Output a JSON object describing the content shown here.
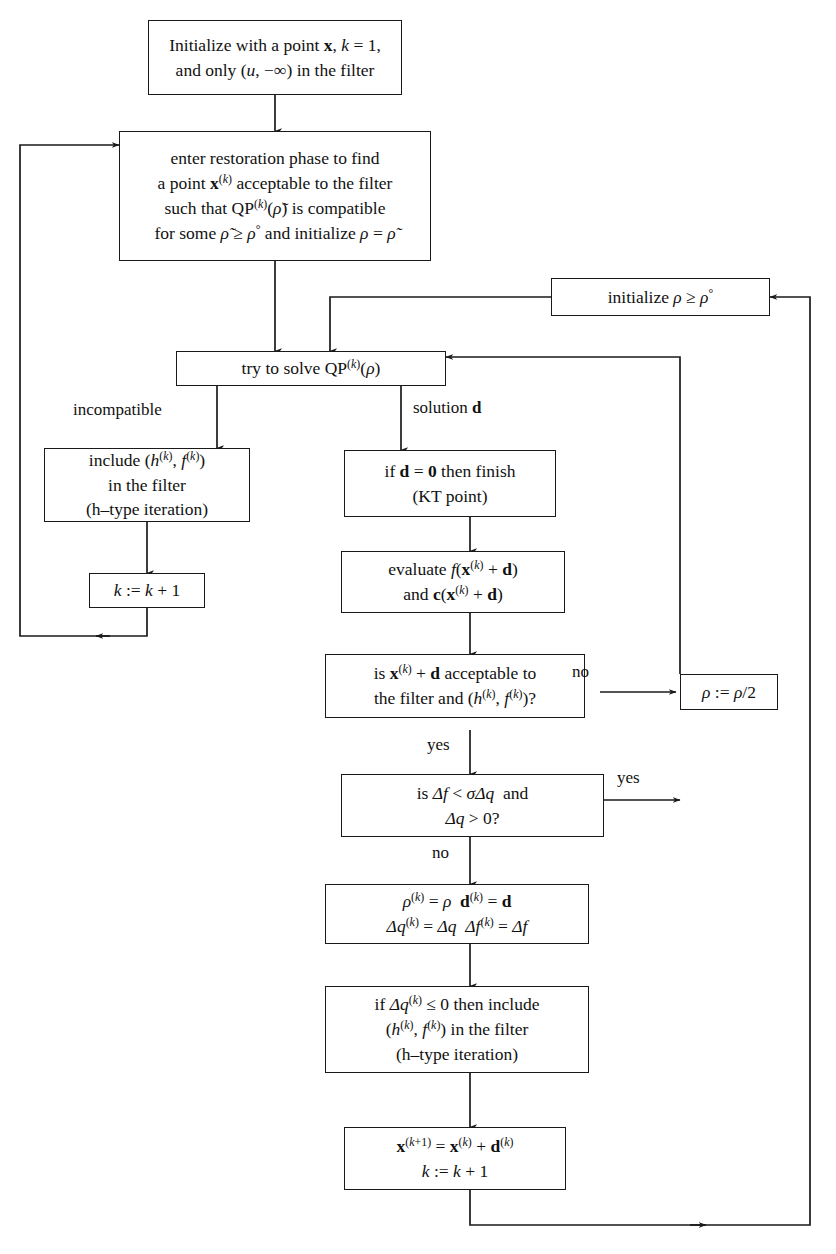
{
  "diagram": {
    "stroke_color": "#1a1a1a",
    "background": "#ffffff"
  },
  "nodes": {
    "initialize": {
      "id": "initialize-box",
      "lines": [
        "Initialize with a point x, k = 1,",
        "and only (u, −∞) in the filter"
      ]
    },
    "restoration": {
      "id": "restoration-phase-box",
      "lines": [
        "enter restoration phase to find",
        "a point x(k) acceptable to the filter",
        "such that QP(k)(ρ̃) is compatible",
        "for some ρ̃ ≥ ρ° and initialize ρ = ρ̃"
      ]
    },
    "initialize_rho": {
      "id": "initialize-rho-box",
      "lines": [
        "initialize ρ ≥ ρ°"
      ]
    },
    "try_solve_qp": {
      "id": "try-to-solve-qp-box",
      "lines": [
        "try to solve QP(k)(ρ)"
      ]
    },
    "include_filter": {
      "id": "include-in-filter-box",
      "lines": [
        "include (h(k), f(k))",
        "in the filter",
        "(h–type iteration)"
      ]
    },
    "k_increment": {
      "id": "k-increment-box",
      "lines": [
        "k := k + 1"
      ]
    },
    "kt_point": {
      "id": "kt-point-box",
      "lines": [
        "if d = 0 then finish",
        "(KT point)"
      ]
    },
    "evaluate": {
      "id": "evaluate-box",
      "lines": [
        "evaluate f(x(k) + d)",
        "and c(x(k) + d)"
      ]
    },
    "acceptable_test": {
      "id": "acceptability-decision-box",
      "lines": [
        "is x(k) + d acceptable to",
        "the filter and (h(k), f(k))?"
      ]
    },
    "rho_halve": {
      "id": "rho-halve-box",
      "lines": [
        "ρ := ρ/2"
      ]
    },
    "sufficient_reduction": {
      "id": "sufficient-reduction-decision-box",
      "lines": [
        "is Δf < σΔq  and",
        "Δq > 0?"
      ]
    },
    "assign_accepted": {
      "id": "assign-accepted-values-box",
      "lines": [
        "ρ(k) = ρ   d(k) = d",
        "Δq(k) = Δq   Δf(k) = Δf"
      ]
    },
    "maybe_include": {
      "id": "conditional-include-filter-box",
      "lines": [
        "if Δq(k) ≤ 0 then include",
        "(h(k), f(k)) in the filter",
        "(h–type iteration)"
      ]
    },
    "update_x": {
      "id": "update-iterate-box",
      "lines": [
        "x(k+1) = x(k) + d(k)",
        "k := k + 1"
      ]
    }
  },
  "edge_labels": {
    "incompatible": "incompatible",
    "solution_d": "solution d",
    "no_acceptable": "no",
    "yes_acceptable": "yes",
    "yes_reduction": "yes",
    "no_reduction": "no"
  }
}
